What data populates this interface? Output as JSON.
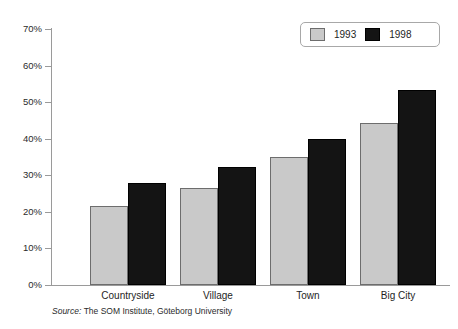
{
  "chart_data": {
    "type": "bar",
    "title": "",
    "subtitle": "",
    "xlabel": "",
    "ylabel": "",
    "categories": [
      "Countryside",
      "Village",
      "Town",
      "Big City"
    ],
    "series": [
      {
        "name": "1993",
        "color": "#c9c9c9",
        "values": [
          21.7,
          26.5,
          35.0,
          44.4
        ]
      },
      {
        "name": "1998",
        "color": "#141414",
        "values": [
          28.0,
          32.4,
          40.0,
          53.4
        ]
      }
    ],
    "ylim": [
      0,
      70
    ],
    "ytick_values": [
      0,
      10,
      20,
      30,
      40,
      50,
      60,
      70
    ],
    "ytick_labels": [
      "0%",
      "10%",
      "20%",
      "30%",
      "40%",
      "50%",
      "60%",
      "70%"
    ],
    "grid": false,
    "legend_position": "top-right",
    "value_format": "percent"
  },
  "legend": {
    "entries": [
      {
        "label": "1993",
        "swatch": "legend-swatch-1993"
      },
      {
        "label": "1998",
        "swatch": "legend-swatch-1998"
      }
    ]
  },
  "source": {
    "keyword": "Source:",
    "text": "The SOM Institute, Göteborg University"
  },
  "colors": {
    "series_1993": "#c9c9c9",
    "series_1998": "#141414",
    "axis": "#9a9a9a",
    "text": "#1e1e1e",
    "background": "#ffffff"
  }
}
